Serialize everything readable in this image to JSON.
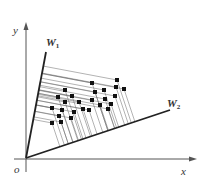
{
  "diagram": {
    "type": "projection-diagram",
    "labels": {
      "y_axis": "y",
      "x_axis": "x",
      "origin": "o",
      "w1_main": "W",
      "w1_sub": "1",
      "w2_main": "W",
      "w2_sub": "2"
    },
    "colors": {
      "axis": "#555555",
      "projection_line": "#222222",
      "guide_line": "#666666",
      "point": "#111111",
      "label": "#333333"
    },
    "origin": [
      26,
      158
    ],
    "y_axis": {
      "from": [
        26,
        172
      ],
      "to": [
        26,
        22
      ]
    },
    "x_axis": {
      "from": [
        14,
        159
      ],
      "to": [
        197,
        159
      ]
    },
    "w1_line": {
      "from": [
        26,
        158
      ],
      "to": [
        46,
        52
      ]
    },
    "w2_line": {
      "from": [
        26,
        158
      ],
      "to": [
        170,
        110
      ]
    },
    "points": [
      [
        117,
        80
      ],
      [
        92,
        83
      ],
      [
        116,
        87
      ],
      [
        124,
        89
      ],
      [
        65,
        90
      ],
      [
        95,
        92
      ],
      [
        104,
        90
      ],
      [
        72,
        96
      ],
      [
        115,
        96
      ],
      [
        58,
        97
      ],
      [
        105,
        99
      ],
      [
        65,
        102
      ],
      [
        79,
        102
      ],
      [
        92,
        100
      ],
      [
        100,
        105
      ],
      [
        111,
        104
      ],
      [
        52,
        108
      ],
      [
        62,
        110
      ],
      [
        74,
        112
      ],
      [
        83,
        109
      ],
      [
        89,
        110
      ],
      [
        108,
        109
      ],
      [
        59,
        116
      ],
      [
        71,
        118
      ],
      [
        52,
        123
      ],
      [
        61,
        122
      ]
    ]
  }
}
